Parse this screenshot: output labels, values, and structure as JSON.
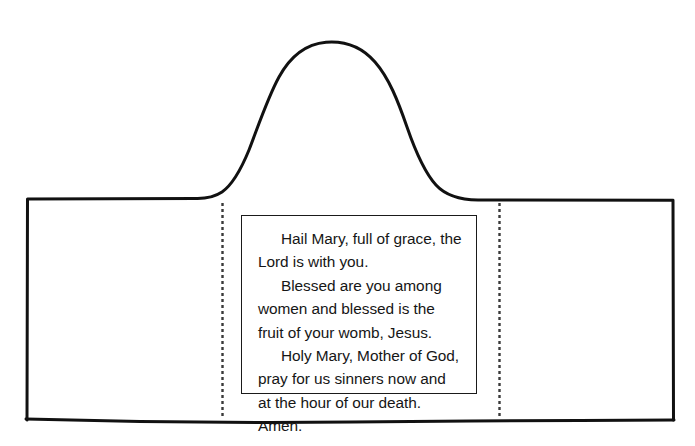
{
  "document": {
    "title": "Hail Mary Prayer Craft Template",
    "description": "Line-drawing outline of a hooded garment / arched shape with two vertical dashed fold lines and a bordered text box containing the Hail Mary prayer."
  },
  "colors": {
    "outline": "#111111",
    "fold_line": "#3a3a3a",
    "text_box_border": "#1a1a1a",
    "text": "#161616",
    "background": "#ffffff"
  },
  "shape": {
    "name": "hooded-garment-outline",
    "stroke_width_px": 3,
    "peak_label": "hood-arch-peak",
    "left_shoulder_label": "left-shoulder",
    "right_shoulder_label": "right-shoulder"
  },
  "fold_lines": [
    {
      "name": "left-fold-line",
      "x": 222,
      "y_start": 203,
      "y_end": 416,
      "style": "dashed"
    },
    {
      "name": "right-fold-line",
      "x": 499,
      "y_start": 203,
      "y_end": 416,
      "style": "dashed"
    }
  ],
  "prayer_box": {
    "x": 241,
    "y": 215,
    "width": 236,
    "height": 179,
    "border": "1.5px solid"
  },
  "prayer": {
    "paragraphs": [
      "Hail Mary, full of grace, the Lord is with you.",
      "Blessed are you among women and blessed is the fruit of your womb, Jesus.",
      "Holy Mary, Mother of God, pray for us sinners now and at the hour of our death. Amen."
    ],
    "full_text": "Hail Mary, full of grace, the Lord is with you.\nBlessed are you among women and blessed is the fruit of your womb, Jesus.\nHoly Mary, Mother of God, pray for us sinners now and at the hour of our death. Amen."
  }
}
